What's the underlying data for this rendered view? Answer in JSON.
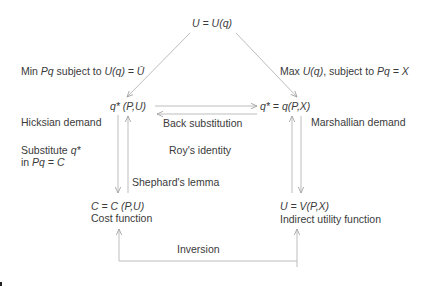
{
  "diagram": {
    "top_node": "U = U(q)",
    "left_edge_label": {
      "prefix": "Min ",
      "pq": "Pq",
      "mid": " subject to ",
      "uq": "U(q)",
      "rhs": " = Ū"
    },
    "right_edge_label": {
      "prefix": "Max ",
      "uq": "U(q)",
      "mid": ", subject to ",
      "pq": "Pq = X"
    },
    "hicksian_node": "q* (P,U)",
    "marshallian_node": "q* = q(P,X)",
    "hicksian_label": "Hicksian demand",
    "marshallian_label": "Marshallian demand",
    "back_substitution_label": "Back substitution",
    "substitute_label": {
      "line1_prefix": "Substitute ",
      "line1_var": "q*",
      "line2_prefix": "in ",
      "line2_eq": "Pq = C"
    },
    "roys_identity_label": "Roy's identity",
    "shephards_lemma_label": "Shephard's lemma",
    "cost_node": "C = C (P,U)",
    "cost_label": "Cost function",
    "indirect_node": "U = V(P,X)",
    "indirect_label": "Indirect utility function",
    "inversion_label": "Inversion",
    "line_color": "#bdbdbd",
    "text_color": "#3a3a3a"
  }
}
